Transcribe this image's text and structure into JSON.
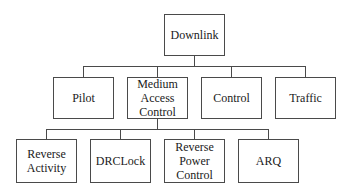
{
  "diagram": {
    "type": "tree",
    "root": {
      "label": "Downlink",
      "children": [
        {
          "label": "Pilot"
        },
        {
          "label": "Medium\nAccess\nControl",
          "children": [
            {
              "label": "Reverse\nActivity"
            },
            {
              "label": "DRCLock"
            },
            {
              "label": "Reverse\nPower\nControl"
            },
            {
              "label": "ARQ"
            }
          ]
        },
        {
          "label": "Control"
        },
        {
          "label": "Traffic"
        }
      ]
    }
  },
  "colors": {
    "line": "#4a4a4a",
    "text": "#1a1a1a",
    "background": "#ffffff"
  }
}
